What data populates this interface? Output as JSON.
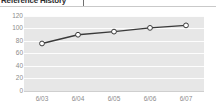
{
  "header": {
    "title": "Reference History",
    "divider": "|"
  },
  "chart_data": {
    "type": "line",
    "title": "",
    "xlabel": "",
    "ylabel": "",
    "categories": [
      "6/03",
      "6/04",
      "6/05",
      "6/06",
      "6/07"
    ],
    "values": [
      76,
      90,
      95,
      101,
      105
    ],
    "series": [
      {
        "name": "series-1",
        "values": [
          76,
          90,
          95,
          101,
          105
        ]
      }
    ],
    "ylim": [
      0,
      120
    ],
    "yticks": [
      0,
      20,
      40,
      60,
      80,
      100,
      120
    ],
    "ytick_labels": [
      "0",
      "20",
      "40",
      "60",
      "80",
      "100",
      "120"
    ],
    "grid": true,
    "grid_orientation": "horizontal",
    "legend": false,
    "legend_position": "none",
    "marker": "open-circle"
  },
  "colors": {
    "plot_background": "#e7e7e7",
    "gridline": "#fdfdfd",
    "line": "#3a3a3a",
    "marker_fill": "#ffffff",
    "marker_stroke": "#3a3a3a",
    "tick_text": "#8c8c8c",
    "header_text": "#2e2e2e",
    "page_background": "#ffffff"
  }
}
